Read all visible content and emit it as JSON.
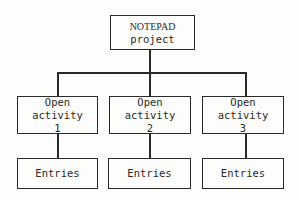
{
  "diagram": {
    "type": "hierarchy",
    "root": {
      "line1": "NOTEPAD",
      "line2": "project"
    },
    "activities": [
      {
        "line1": "Open activity",
        "line2": "1",
        "child": "Entries"
      },
      {
        "line1": "Open activity",
        "line2": "2",
        "child": "Entries"
      },
      {
        "line1": "Open activity",
        "line2": "3",
        "child": "Entries"
      }
    ]
  }
}
